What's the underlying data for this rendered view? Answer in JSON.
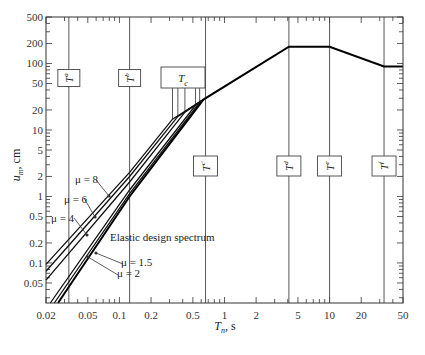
{
  "chart_data": {
    "type": "line",
    "title": "",
    "xlabel": "T_n, s",
    "ylabel": "u_m, cm",
    "xscale": "log",
    "yscale": "log",
    "xlim": [
      0.02,
      50
    ],
    "ylim": [
      0.025,
      500
    ],
    "grid": false,
    "x_ticks": [
      0.02,
      0.05,
      0.1,
      0.2,
      0.5,
      1,
      2,
      5,
      10,
      20,
      50
    ],
    "x_tick_labels": [
      "0.02",
      "0.05",
      "0.1",
      "0.2",
      "0.5",
      "1",
      "2",
      "5",
      "10",
      "20",
      "50"
    ],
    "y_ticks": [
      0.05,
      0.1,
      0.2,
      0.5,
      1,
      2,
      5,
      10,
      20,
      50,
      100,
      200,
      500
    ],
    "y_tick_labels": [
      "0.05",
      "0.1",
      "0.2",
      "0.5",
      "1",
      "2",
      "5",
      "10",
      "20",
      "50",
      "100",
      "200",
      "500"
    ],
    "period_markers": [
      {
        "name": "T_a",
        "main": "T",
        "sub": "a",
        "T": 0.033,
        "box_position": "upper"
      },
      {
        "name": "T_b",
        "main": "T",
        "sub": "b",
        "T": 0.125,
        "box_position": "upper"
      },
      {
        "name": "T_c",
        "main": "T",
        "sub": "c",
        "T": null,
        "box_position": "upper-group",
        "note": "group of T_c values for each mu"
      },
      {
        "name": "T_c'",
        "main": "T",
        "sub": "c'",
        "T": 0.66,
        "box_position": "lower"
      },
      {
        "name": "T_d",
        "main": "T",
        "sub": "d",
        "T": 4.1,
        "box_position": "lower"
      },
      {
        "name": "T_e",
        "main": "T",
        "sub": "e",
        "T": 10,
        "box_position": "lower"
      },
      {
        "name": "T_f",
        "main": "T",
        "sub": "f",
        "T": 33,
        "box_position": "lower"
      }
    ],
    "series": [
      {
        "name": "mu = 8",
        "x": [
          0.02,
          0.125,
          0.32,
          0.63
        ],
        "y": [
          0.095,
          2.3,
          14.5,
          28.6
        ]
      },
      {
        "name": "mu = 6",
        "x": [
          0.02,
          0.125,
          0.36,
          0.63
        ],
        "y": [
          0.075,
          2.0,
          16.0,
          28.6
        ]
      },
      {
        "name": "mu = 4",
        "x": [
          0.02,
          0.125,
          0.42,
          0.63
        ],
        "y": [
          0.055,
          1.65,
          18.5,
          28.6
        ]
      },
      {
        "name": "mu = 2",
        "x": [
          0.022,
          0.125,
          0.53,
          0.63
        ],
        "y": [
          0.025,
          1.25,
          23.5,
          28.6
        ]
      },
      {
        "name": "mu = 1.5",
        "x": [
          0.024,
          0.125,
          0.58,
          0.63
        ],
        "y": [
          0.025,
          1.1,
          26.0,
          28.6
        ]
      },
      {
        "name": "Elastic design spectrum",
        "x": [
          0.026,
          0.125,
          0.63,
          4.1,
          10,
          33,
          50
        ],
        "y": [
          0.025,
          1.0,
          28.6,
          179,
          179,
          90,
          90
        ]
      }
    ],
    "annotations": [
      {
        "text": "μ = 8",
        "target_series": "mu = 8"
      },
      {
        "text": "μ = 6",
        "target_series": "mu = 6"
      },
      {
        "text": "μ = 4",
        "target_series": "mu = 4"
      },
      {
        "text": "Elastic design spectrum",
        "target_series": "Elastic design spectrum"
      },
      {
        "text": "μ = 1.5",
        "target_series": "mu = 1.5"
      },
      {
        "text": "μ = 2",
        "target_series": "mu = 2"
      }
    ]
  },
  "labels": {
    "x_axis_main": "T",
    "x_axis_sub": "n",
    "x_axis_unit": ", s",
    "y_axis_main": "u",
    "y_axis_sub": "m",
    "y_axis_unit": ", cm",
    "mu8": "μ = 8",
    "mu6": "μ = 6",
    "mu4": "μ = 4",
    "mu15": "μ = 1.5",
    "mu2": "μ = 2",
    "elastic": "Elastic design spectrum",
    "T": "T",
    "sub_a": "a",
    "sub_b": "b",
    "sub_c": "c",
    "sub_d": "d",
    "sub_e": "e",
    "sub_f": "f"
  }
}
